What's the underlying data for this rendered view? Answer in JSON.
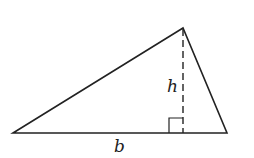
{
  "diagram": {
    "labels": {
      "height": "h",
      "base": "b"
    },
    "colors": {
      "stroke": "#222222",
      "background": "#ffffff"
    },
    "vertices": {
      "left": [
        13,
        133
      ],
      "apex": [
        183,
        28
      ],
      "right": [
        227,
        133
      ]
    }
  }
}
